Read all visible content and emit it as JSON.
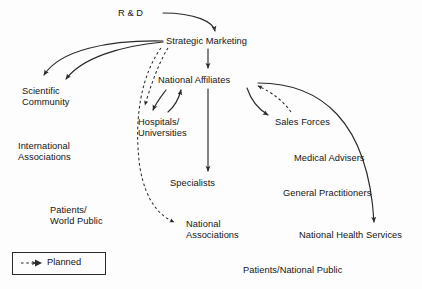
{
  "diagram": {
    "background_color": "#fdfdfd",
    "line_color": "#2a2a2a",
    "text_color": "#141414",
    "nodes": [
      {
        "id": "rd",
        "label": "R & D",
        "x": 118,
        "y": 8,
        "align": "left"
      },
      {
        "id": "strategic_marketing",
        "label": "Strategic Marketing",
        "x": 166,
        "y": 36,
        "align": "left"
      },
      {
        "id": "scientific_community",
        "label": "Scientific\nCommunity",
        "x": 22,
        "y": 86,
        "align": "left"
      },
      {
        "id": "national_affiliates",
        "label": "National Affiliates",
        "x": 158,
        "y": 75,
        "align": "left"
      },
      {
        "id": "hospitals_universities",
        "label": "Hospitals/\nUniversities",
        "x": 138,
        "y": 117,
        "align": "left"
      },
      {
        "id": "sales_forces",
        "label": "Sales Forces",
        "x": 275,
        "y": 117,
        "align": "left"
      },
      {
        "id": "international_associations",
        "label": "International\nAssociations",
        "x": 18,
        "y": 141,
        "align": "left"
      },
      {
        "id": "medical_advisers",
        "label": "Medical Advisers",
        "x": 294,
        "y": 153,
        "align": "left"
      },
      {
        "id": "specialists",
        "label": "Specialists",
        "x": 170,
        "y": 178,
        "align": "left"
      },
      {
        "id": "general_practitioners",
        "label": "General Practitioners",
        "x": 283,
        "y": 188,
        "align": "left"
      },
      {
        "id": "patients_world_public",
        "label": "Patients/\nWorld Public",
        "x": 50,
        "y": 205,
        "align": "left"
      },
      {
        "id": "national_associations",
        "label": "National\nAssociations",
        "x": 186,
        "y": 219,
        "align": "left"
      },
      {
        "id": "national_health_services",
        "label": "National Health Services",
        "x": 299,
        "y": 230,
        "align": "left"
      },
      {
        "id": "patients_national_public",
        "label": "Patients/National Public",
        "x": 243,
        "y": 265,
        "align": "left"
      }
    ],
    "edges": [
      {
        "id": "rd-to-strategic-marketing",
        "from": "rd",
        "to": "strategic_marketing",
        "style": "solid"
      },
      {
        "id": "strategic-marketing-to-scientific-community-1",
        "from": "strategic_marketing",
        "to": "scientific_community",
        "style": "solid"
      },
      {
        "id": "strategic-marketing-to-scientific-community-2",
        "from": "strategic_marketing",
        "to": "scientific_community",
        "style": "solid"
      },
      {
        "id": "strategic-marketing-to-national-affiliates",
        "from": "strategic_marketing",
        "to": "national_affiliates",
        "style": "solid"
      },
      {
        "id": "strategic-marketing-to-hospitals-universities",
        "from": "strategic_marketing",
        "to": "hospitals_universities",
        "style": "dashed"
      },
      {
        "id": "strategic-marketing-to-national-associations",
        "from": "strategic_marketing",
        "to": "national_associations",
        "style": "dashed"
      },
      {
        "id": "national-affiliates-to-hospitals-universities",
        "from": "national_affiliates",
        "to": "hospitals_universities",
        "style": "solid"
      },
      {
        "id": "hospitals-universities-to-national-affiliates",
        "from": "hospitals_universities",
        "to": "national_affiliates",
        "style": "solid"
      },
      {
        "id": "national-affiliates-to-specialists",
        "from": "national_affiliates",
        "to": "specialists",
        "style": "solid"
      },
      {
        "id": "national-affiliates-to-sales-forces",
        "from": "national_affiliates",
        "to": "sales_forces",
        "style": "solid"
      },
      {
        "id": "sales-forces-to-national-affiliates",
        "from": "sales_forces",
        "to": "national_affiliates",
        "style": "dashed"
      },
      {
        "id": "national-affiliates-to-national-health-services",
        "from": "national_affiliates",
        "to": "national_health_services",
        "style": "solid"
      }
    ]
  },
  "legend": {
    "label": "Planned",
    "line_style": "dashed"
  }
}
